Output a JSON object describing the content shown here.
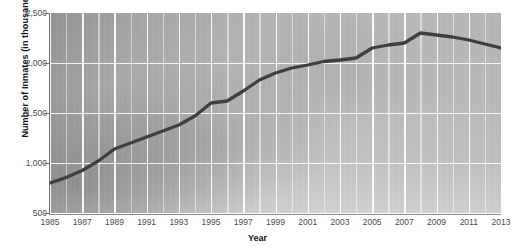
{
  "chart_data": {
    "type": "line",
    "title": "Number of Inmates in U.S. Prisons and Jails",
    "xlabel": "Year",
    "ylabel": "Number of Inmates (in thousands)",
    "xlim": [
      1985,
      2013
    ],
    "ylim": [
      500,
      2500
    ],
    "y_ticks": [
      "2,500",
      "2,000",
      "1,500",
      "1,000",
      "500"
    ],
    "y_tick_values": [
      2500,
      2000,
      1500,
      1000,
      500
    ],
    "x_ticks": [
      "1985",
      "1987",
      "1989",
      "1991",
      "1993",
      "1995",
      "1997",
      "1999",
      "2001",
      "2003",
      "2005",
      "2007",
      "2009",
      "2011",
      "2013"
    ],
    "x_tick_values": [
      1985,
      1987,
      1989,
      1991,
      1993,
      1995,
      1997,
      1999,
      2001,
      2003,
      2005,
      2007,
      2009,
      2011,
      2013
    ],
    "grid": "both",
    "legend": "none",
    "series": [
      {
        "name": "Number of Inmates (in thousands)",
        "color": "#3f3f3f",
        "x": [
          1985,
          1986,
          1987,
          1988,
          1989,
          1990,
          1991,
          1992,
          1993,
          1994,
          1995,
          1996,
          1997,
          1998,
          1999,
          2000,
          2001,
          2002,
          2003,
          2004,
          2005,
          2006,
          2007,
          2008,
          2009,
          2010,
          2011,
          2012,
          2013
        ],
        "values": [
          800,
          855,
          925,
          1020,
          1140,
          1200,
          1260,
          1320,
          1380,
          1470,
          1600,
          1620,
          1720,
          1830,
          1900,
          1950,
          1980,
          2015,
          2030,
          2050,
          2150,
          2180,
          2200,
          2300,
          2280,
          2260,
          2230,
          2190,
          2150
        ]
      }
    ]
  },
  "axes": {
    "y_title": "Number of Inmates (in thousands)",
    "x_title": "Year"
  },
  "colors": {
    "line": "#3f3f3f",
    "gridline": "#ffffff",
    "plot_background_dark": "#8f8f8f",
    "plot_background_light": "#f2f2f2",
    "tick_label": "#4a4a4a",
    "axis_title": "#111111"
  }
}
